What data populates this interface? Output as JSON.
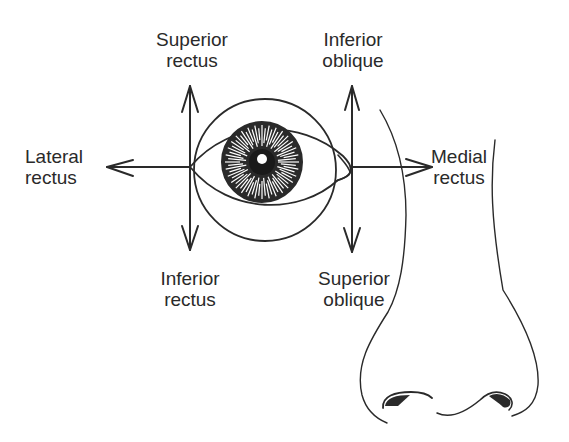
{
  "diagram": {
    "labels": {
      "superior_rectus": [
        "Superior",
        "rectus"
      ],
      "inferior_oblique": [
        "Inferior",
        "oblique"
      ],
      "lateral_rectus": [
        "Lateral",
        "rectus"
      ],
      "medial_rectus": [
        "Medial",
        "rectus"
      ],
      "inferior_rectus": [
        "Inferior",
        "rectus"
      ],
      "superior_oblique": [
        "Superior",
        "oblique"
      ]
    },
    "colors": {
      "ink": "#2a2a2a",
      "background": "#ffffff"
    }
  }
}
